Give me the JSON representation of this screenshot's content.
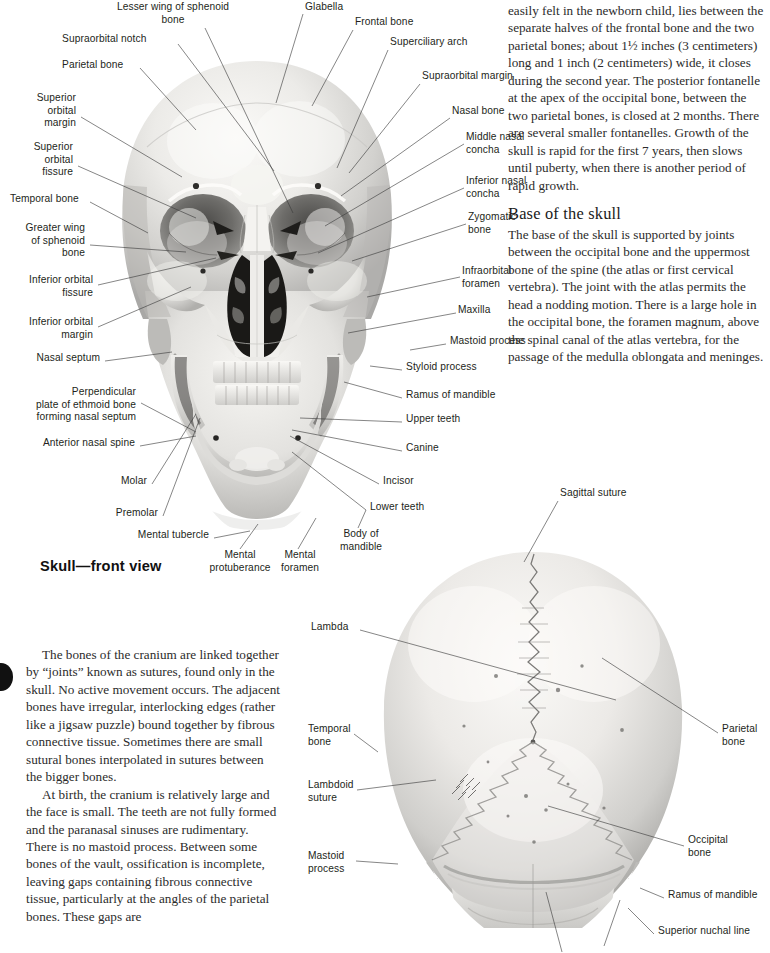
{
  "figures": {
    "front": {
      "caption": "Skull—front view",
      "labels_left": [
        {
          "text": "Lesser wing of sphenoid\nbone",
          "x": 88,
          "y": 2,
          "align": "center",
          "lx": 205,
          "ly": 28,
          "tx": 293,
          "ty": 213
        },
        {
          "text": "Supraorbital notch",
          "x": 62,
          "y": 38,
          "align": "left",
          "lx": 178,
          "ly": 44,
          "tx": 274,
          "ty": 171
        },
        {
          "text": "Parietal bone",
          "x": 62,
          "y": 62,
          "align": "left",
          "lx": 140,
          "ly": 68,
          "tx": 106,
          "ty": 130
        },
        {
          "text": "Superior\norbital\nmargin",
          "x": 31,
          "y": 95,
          "align": "right",
          "lx": 81,
          "ly": 117,
          "tx": 182,
          "ty": 177
        },
        {
          "text": "Superior\norbital\nfissure",
          "x": 31,
          "y": 144,
          "align": "right",
          "lx": 78,
          "ly": 166,
          "tx": 196,
          "ty": 218
        },
        {
          "text": "Temporal bone",
          "x": 10,
          "y": 196,
          "align": "left",
          "lx": 90,
          "ly": 202,
          "tx": 103,
          "ty": 225
        },
        {
          "text": "Greater wing\nof sphenoid\nbone",
          "x": 14,
          "y": 225,
          "align": "right",
          "lx": 90,
          "ly": 245,
          "tx": 186,
          "ty": 252
        },
        {
          "text": "Inferior orbital\nfissure",
          "x": 24,
          "y": 278,
          "align": "right",
          "lx": 98,
          "ly": 285,
          "tx": 206,
          "ty": 258
        },
        {
          "text": "Inferior orbital\nmargin",
          "x": 24,
          "y": 320,
          "align": "right",
          "lx": 98,
          "ly": 327,
          "tx": 191,
          "ty": 287
        },
        {
          "text": "Nasal septum",
          "x": 32,
          "y": 355,
          "align": "left",
          "lx": 105,
          "ly": 361,
          "tx": 160,
          "ty": 352
        },
        {
          "text": "Perpendicular\nplate of ethmoid bone\nforming nasal septum",
          "x": 10,
          "y": 390,
          "align": "right",
          "lx": 141,
          "ly": 403,
          "tx": 193,
          "ty": 427
        },
        {
          "text": "Anterior nasal spine",
          "x": 45,
          "y": 440,
          "align": "left",
          "lx": 140,
          "ly": 446,
          "tx": 193,
          "ty": 431
        },
        {
          "text": "Molar",
          "x": 118,
          "y": 478,
          "align": "left",
          "lx": 152,
          "ly": 484,
          "tx": 180,
          "ty": 439
        },
        {
          "text": "Premolar",
          "x": 118,
          "y": 511,
          "align": "left",
          "lx": 163,
          "ly": 516,
          "tx": 180,
          "ty": 443
        },
        {
          "text": "Mental tubercle",
          "x": 140,
          "y": 532,
          "align": "left",
          "lx": 214,
          "ly": 538,
          "tx": 250,
          "ty": 528
        }
      ],
      "labels_bottom": [
        {
          "text": "Mental\nprotuberance",
          "x": 212,
          "y": 552,
          "align": "center",
          "lx": 240,
          "ly": 551,
          "tx": 258,
          "ty": 527
        },
        {
          "text": "Mental\nforamen",
          "x": 283,
          "y": 552,
          "align": "center",
          "lx": 298,
          "ly": 551,
          "tx": 316,
          "ty": 520
        },
        {
          "text": "Body of\nmandible",
          "x": 337,
          "y": 530,
          "align": "center",
          "lx": 358,
          "ly": 530,
          "tx": 364,
          "ty": 513
        }
      ],
      "labels_right": [
        {
          "text": "Glabella",
          "x": 305,
          "y": 2,
          "align": "left",
          "lx": 303,
          "ly": 14,
          "tx": 276,
          "ty": 103
        },
        {
          "text": "Frontal bone",
          "x": 355,
          "y": 18,
          "align": "left",
          "lx": 353,
          "ly": 30,
          "tx": 312,
          "ty": 106
        },
        {
          "text": "Superciliary arch",
          "x": 390,
          "y": 38,
          "align": "left",
          "lx": 388,
          "ly": 50,
          "tx": 337,
          "ty": 168
        },
        {
          "text": "Supraorbital margin",
          "x": 422,
          "y": 72,
          "align": "left",
          "lx": 420,
          "ly": 84,
          "tx": 349,
          "ty": 173
        },
        {
          "text": "Nasal bone",
          "x": 452,
          "y": 108,
          "align": "left",
          "lx": 450,
          "ly": 118,
          "tx": 341,
          "ty": 196
        },
        {
          "text": "Middle nasal\nconcha",
          "x": 466,
          "y": 134,
          "align": "left",
          "lx": 464,
          "ly": 144,
          "tx": 325,
          "ty": 226
        },
        {
          "text": "Inferior nasal\nconcha",
          "x": 466,
          "y": 178,
          "align": "left",
          "lx": 464,
          "ly": 188,
          "tx": 320,
          "ty": 253
        },
        {
          "text": "Zygomatic\nbone",
          "x": 468,
          "y": 214,
          "align": "left",
          "lx": 466,
          "ly": 224,
          "tx": 348,
          "ty": 261
        },
        {
          "text": "Infraorbital\nforamen",
          "x": 462,
          "y": 268,
          "align": "left",
          "lx": 460,
          "ly": 277,
          "tx": 367,
          "ty": 297
        },
        {
          "text": "Maxilla",
          "x": 458,
          "y": 307,
          "align": "left",
          "lx": 456,
          "ly": 313,
          "tx": 348,
          "ty": 333
        },
        {
          "text": "Mastoid process",
          "x": 448,
          "y": 338,
          "align": "left",
          "lx": 446,
          "ly": 344,
          "tx": 408,
          "ty": 350
        },
        {
          "text": "Styloid process",
          "x": 404,
          "y": 364,
          "align": "left",
          "lx": 402,
          "ly": 370,
          "tx": 388,
          "ty": 366
        },
        {
          "text": "Ramus of mandible",
          "x": 404,
          "y": 392,
          "align": "left",
          "lx": 402,
          "ly": 398,
          "tx": 378,
          "ty": 390
        },
        {
          "text": "Upper teeth",
          "x": 404,
          "y": 416,
          "align": "left",
          "lx": 402,
          "ly": 422,
          "tx": 346,
          "ty": 418
        },
        {
          "text": "Canine",
          "x": 404,
          "y": 445,
          "align": "left",
          "lx": 402,
          "ly": 451,
          "tx": 330,
          "ty": 428
        },
        {
          "text": "Incisor",
          "x": 382,
          "y": 478,
          "align": "left",
          "lx": 379,
          "ly": 484,
          "tx": 328,
          "ty": 432
        },
        {
          "text": "Lower teeth",
          "x": 368,
          "y": 504,
          "align": "left",
          "lx": 366,
          "ly": 510,
          "tx": 330,
          "ty": 448
        }
      ]
    },
    "back": {
      "labels": [
        {
          "text": "Sagittal suture",
          "x": 560,
          "y": 490,
          "align": "left",
          "lx": 558,
          "ly": 501,
          "tx": 520,
          "ty": 560
        },
        {
          "text": "Lambda",
          "x": 311,
          "y": 624,
          "align": "left",
          "lx": 360,
          "ly": 630,
          "tx": 616,
          "ty": 699
        },
        {
          "text": "Temporal\nbone",
          "x": 308,
          "y": 726,
          "align": "left",
          "lx": 354,
          "ly": 732,
          "tx": 375,
          "ty": 751
        },
        {
          "text": "Lambdoid\nsuture",
          "x": 308,
          "y": 782,
          "align": "left",
          "lx": 357,
          "ly": 788,
          "tx": 434,
          "ty": 779
        },
        {
          "text": "Mastoid\nprocess",
          "x": 308,
          "y": 853,
          "align": "left",
          "lx": 356,
          "ly": 859,
          "tx": 396,
          "ty": 863
        },
        {
          "text": "Parietal\nbone",
          "x": 722,
          "y": 726,
          "align": "left",
          "lx": 720,
          "ly": 733,
          "tx": 610,
          "ty": 658
        },
        {
          "text": "Occipital\nbone",
          "x": 688,
          "y": 837,
          "align": "left",
          "lx": 686,
          "ly": 844,
          "tx": 545,
          "ty": 804
        },
        {
          "text": "Ramus of mandible",
          "x": 668,
          "y": 892,
          "align": "left",
          "lx": 666,
          "ly": 898,
          "tx": 642,
          "ty": 888
        },
        {
          "text": "Superior nuchal line",
          "x": 658,
          "y": 928,
          "align": "left",
          "lx": 656,
          "ly": 934,
          "tx": 630,
          "ty": 910
        }
      ]
    }
  },
  "text": {
    "right_column": {
      "continued_paragraph": "easily felt in the newborn child, lies between the separate halves of the frontal bone and the two parietal bones; about 1½ inches (3 centimeters) long and 1 inch (2 centimeters) wide, it closes during the second year. The posterior fontanelle at the apex of the occipital bone, between the two parietal bones, is closed at 2 months. There are several smaller fontanelles. Growth of the skull is rapid for the first 7 years, then slows until puberty, when there is another period of rapid growth.",
      "section_heading": "Base of the skull",
      "section_paragraph": "The base of the skull is supported by joints between the occipital bone and the uppermost bone of the spine (the atlas or first cervical vertebra). The joint with the atlas permits the head a nodding motion. There is a large hole in the occipital bone, the foramen magnum, above the spinal canal of the atlas vertebra, for the passage of the medulla oblongata and meninges."
    },
    "left_column": {
      "paragraph_1": "The bones of the cranium are linked together by “joints” known as sutures, found only in the skull. No active movement occurs. The adjacent bones have irregular, interlocking edges (rather like a jigsaw puzzle) bound together by fibrous connective tissue. Sometimes there are small sutural bones interpolated in sutures between the bigger bones.",
      "paragraph_2": "At birth, the cranium is relatively large and the face is small. The teeth are not fully formed and the paranasal sinuses are rudimentary. There is no mastoid process. Between some bones of the vault, ossification is incomplete, leaving gaps containing fibrous connective tissue, particularly at the angles of the parietal bones. These gaps are"
    }
  }
}
